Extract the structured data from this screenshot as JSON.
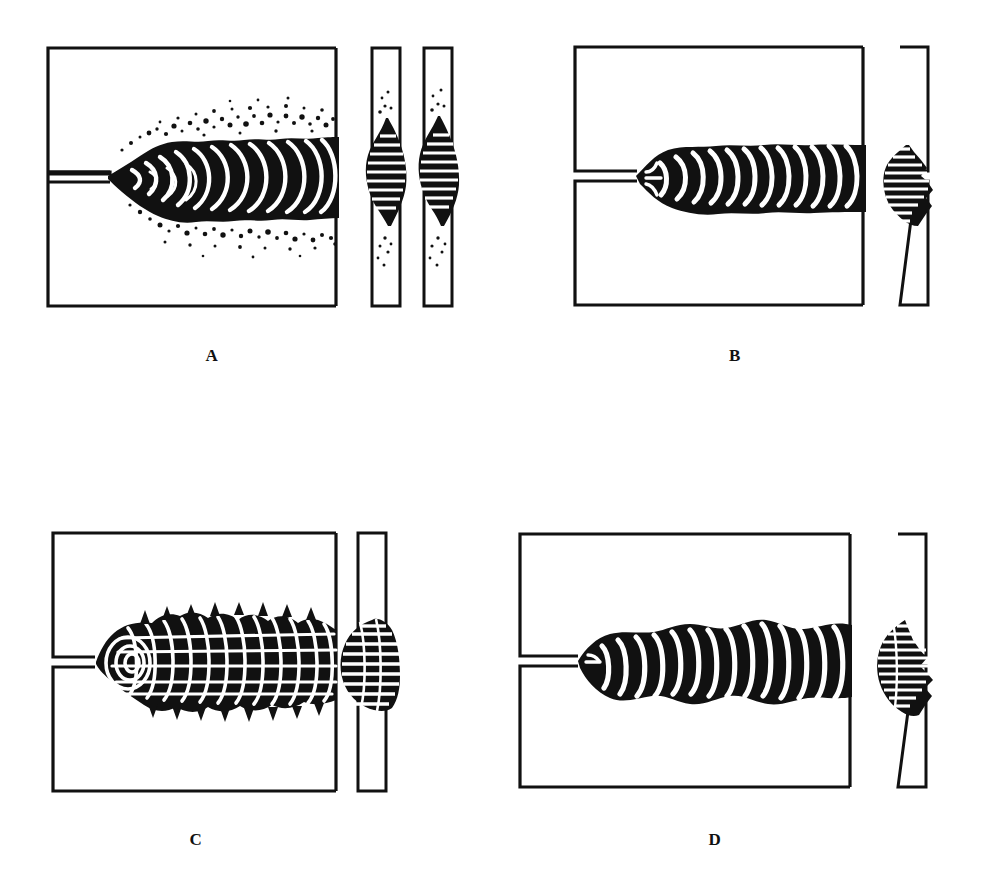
{
  "figure": {
    "background_color": "#ffffff",
    "ink_color": "#111111",
    "panel_count": 4,
    "layout": "2x2 grid of panels, each panel = plan view box + transverse section strip(s)"
  },
  "panels": [
    {
      "id": "A",
      "label": "A",
      "label_x": 212,
      "label_y": 356,
      "plan_view": {
        "box": {
          "x": 48,
          "y": 48,
          "width": 288,
          "height": 258
        },
        "joint_groove": {
          "gap_px": 9,
          "depth_px": 62,
          "center_y": 177
        },
        "bead": {
          "style": "tapered-chevron",
          "description": "Irregular bead that widens from the root and flares toward the run-out; deep chevron ripples; heavy spatter above and below",
          "start_x": 110,
          "end_x": 336,
          "max_half_height": 44,
          "ripple_count": 14,
          "spatter": true,
          "spatter_density": "heavy",
          "spatter_dot_count": 210
        }
      },
      "sections": [
        {
          "strip": {
            "x": 372,
            "y": 48,
            "width": 28,
            "height": 258
          },
          "nugget": {
            "style": "hatched-lens-both-sides",
            "hatch_line_count": 13,
            "spatter": true,
            "penetration": "full",
            "bulge_side": "left"
          }
        },
        {
          "strip": {
            "x": 424,
            "y": 48,
            "width": 28,
            "height": 258
          },
          "nugget": {
            "style": "hatched-lens-both-sides",
            "hatch_line_count": 13,
            "spatter": true,
            "penetration": "full",
            "bulge_side": "both"
          }
        }
      ]
    },
    {
      "id": "B",
      "label": "B",
      "label_x": 735,
      "label_y": 356,
      "plan_view": {
        "box": {
          "x": 575,
          "y": 47,
          "width": 288,
          "height": 258
        },
        "joint_groove": {
          "gap_px": 9,
          "depth_px": 62,
          "center_y": 176
        },
        "bead": {
          "style": "uniform-straight",
          "description": "Uniform width bead with parallel edges and evenly spaced crescent ripples; no spatter",
          "start_x": 637,
          "end_x": 863,
          "max_half_height": 34,
          "ripple_count": 13,
          "spatter": false,
          "spatter_density": "none",
          "spatter_dot_count": 0
        }
      },
      "sections": [
        {
          "strip": {
            "x": 900,
            "y": 47,
            "width": 28,
            "height": 258
          },
          "notch_side": "right",
          "nugget": {
            "style": "hatched-wedge",
            "hatch_line_count": 12,
            "spatter": false,
            "penetration": "full",
            "bulge_side": "left"
          }
        }
      ]
    },
    {
      "id": "C",
      "label": "C",
      "label_x": 196,
      "label_y": 840,
      "plan_view": {
        "box": {
          "x": 53,
          "y": 533,
          "width": 283,
          "height": 258
        },
        "joint_groove": {
          "gap_px": 9,
          "depth_px": 62,
          "center_y": 662
        },
        "bead": {
          "style": "coarse-spiky-crosshatch",
          "description": "Coarse, spiky bead with crosshatched lattice ripples and a concentric spiral at the arc start; ragged saw-tooth edges",
          "start_x": 95,
          "end_x": 336,
          "max_half_height": 36,
          "ripple_count": 16,
          "spiral_at_start": true,
          "spiral_turns": 3,
          "spatter": false,
          "spatter_density": "none",
          "spatter_dot_count": 0
        }
      },
      "sections": [
        {
          "strip": {
            "x": 358,
            "y": 533,
            "width": 28,
            "height": 258
          },
          "notch_side": "none",
          "nugget": {
            "style": "crosshatched-round-blob",
            "hatch_line_count": 11,
            "spatter": false,
            "penetration": "partial",
            "bulge_side": "left"
          }
        }
      ]
    },
    {
      "id": "D",
      "label": "D",
      "label_x": 715,
      "label_y": 840,
      "plan_view": {
        "box": {
          "x": 520,
          "y": 534,
          "width": 330,
          "height": 253
        },
        "joint_groove": {
          "gap_px": 9,
          "depth_px": 68,
          "center_y": 661
        },
        "bead": {
          "style": "lumpy-irregular",
          "description": "Lumpy bead of varying width with bulges and necks; long slanted ripple slits; no spatter",
          "start_x": 578,
          "end_x": 850,
          "max_half_height": 32,
          "ripple_count": 16,
          "spatter": false,
          "spatter_density": "none",
          "spatter_dot_count": 0
        }
      },
      "sections": [
        {
          "strip": {
            "x": 898,
            "y": 534,
            "width": 28,
            "height": 253
          },
          "notch_side": "right",
          "nugget": {
            "style": "hatched-irregular-drop",
            "hatch_line_count": 14,
            "spatter": false,
            "penetration": "full",
            "bulge_side": "left"
          }
        }
      ]
    }
  ]
}
